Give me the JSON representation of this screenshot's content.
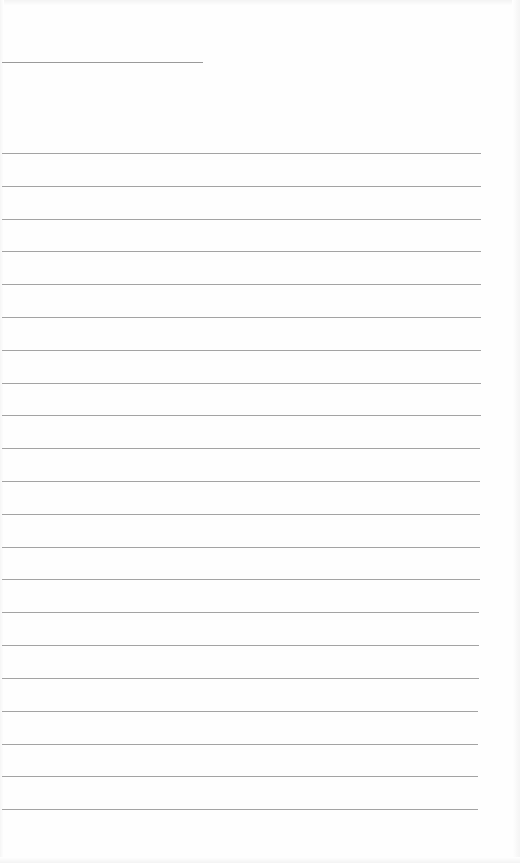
{
  "document": {
    "type": "blank ruled sheet",
    "text": "",
    "colors": {
      "paper": "#fefefe",
      "rule": "#a3a3a3",
      "header_rule": "#9a9a9a"
    },
    "header_line": {
      "x": 2,
      "y": 62,
      "width": 201
    },
    "rules": [
      {
        "y": 153,
        "width": 479
      },
      {
        "y": 186,
        "width": 479
      },
      {
        "y": 219,
        "width": 479
      },
      {
        "y": 251,
        "width": 479
      },
      {
        "y": 284,
        "width": 479
      },
      {
        "y": 317,
        "width": 479
      },
      {
        "y": 350,
        "width": 479
      },
      {
        "y": 383,
        "width": 479
      },
      {
        "y": 415,
        "width": 479
      },
      {
        "y": 448,
        "width": 478
      },
      {
        "y": 481,
        "width": 478
      },
      {
        "y": 514,
        "width": 478
      },
      {
        "y": 547,
        "width": 478
      },
      {
        "y": 579,
        "width": 478
      },
      {
        "y": 612,
        "width": 477
      },
      {
        "y": 645,
        "width": 477
      },
      {
        "y": 678,
        "width": 477
      },
      {
        "y": 711,
        "width": 476
      },
      {
        "y": 744,
        "width": 476
      },
      {
        "y": 776,
        "width": 476
      },
      {
        "y": 809,
        "width": 476
      }
    ]
  }
}
